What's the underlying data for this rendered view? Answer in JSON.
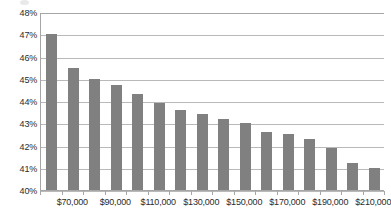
{
  "chart_data": {
    "type": "bar",
    "title": "",
    "subtitle": "",
    "xlabel": "",
    "ylabel": "",
    "categories": [
      "$65,000",
      "$75,000",
      "$85,000",
      "$95,000",
      "$105,000",
      "$115,000",
      "$125,000",
      "$135,000",
      "$145,000",
      "$155,000",
      "$165,000",
      "$175,000",
      "$185,000",
      "$195,000",
      "$205,000",
      "$215,000"
    ],
    "values": [
      47.0,
      45.5,
      45.0,
      44.7,
      44.3,
      43.9,
      43.6,
      43.4,
      43.2,
      43.0,
      42.6,
      42.5,
      42.3,
      41.9,
      41.2,
      41.0
    ],
    "value_labels": [
      "47.0%",
      "45.5%",
      "45.0%",
      "44.7%",
      "44.3%",
      "43.9%",
      "43.6%",
      "43.4%",
      "43.2%",
      "43.0%",
      "42.6%",
      "42.5%",
      "42.3%",
      "41.9%",
      "41.2%",
      "41.0%"
    ],
    "ylim": [
      40,
      48
    ],
    "ytick_values": [
      40,
      41,
      42,
      43,
      44,
      45,
      46,
      47,
      48
    ],
    "ytick_labels": [
      "40%",
      "41%",
      "42%",
      "43%",
      "44%",
      "45%",
      "46%",
      "47%",
      "48%"
    ],
    "xtick_labels": [
      "$70,000",
      "$90,000",
      "$110,000",
      "$130,000",
      "$150,000",
      "$170,000",
      "$190,000",
      "$210,000"
    ],
    "xtick_label_bar_indices": [
      1,
      3,
      5,
      7,
      9,
      11,
      13,
      15
    ],
    "grid": true,
    "grid_axis": "y",
    "legend": false,
    "legend_position": "none",
    "bar_color": "#808080",
    "gridline_color": "#b9b9b9",
    "axis_color": "#a6a6a6",
    "background_color": "#ffffff",
    "text_color": "#2b2b2b"
  }
}
